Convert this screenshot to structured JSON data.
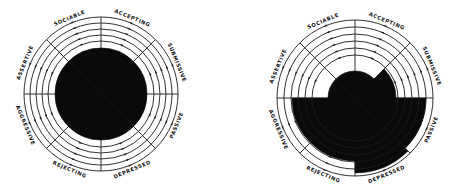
{
  "diagrams": [
    {
      "id": "left",
      "center": [
        101,
        94
      ],
      "outer_radius": 77,
      "ring_radii": [
        77,
        71,
        65,
        59,
        53
      ],
      "fill_color": "#0a0a0a",
      "line_color": "#1a1a1a",
      "sectors": [
        {
          "label": "SOCIABLE",
          "start_deg": 90,
          "end_deg": 135,
          "fill_radius": 46
        },
        {
          "label": "ACCEPTING",
          "start_deg": 45,
          "end_deg": 90,
          "fill_radius": 46
        },
        {
          "label": "SUBMISSIVE",
          "start_deg": 0,
          "end_deg": 45,
          "fill_radius": 46
        },
        {
          "label": "PASSIVE",
          "start_deg": -45,
          "end_deg": 0,
          "fill_radius": 46
        },
        {
          "label": "DEPRESSED",
          "start_deg": -90,
          "end_deg": -45,
          "fill_radius": 46
        },
        {
          "label": "REJECTING",
          "start_deg": -135,
          "end_deg": -90,
          "fill_radius": 46
        },
        {
          "label": "AGGRESSIVE",
          "start_deg": -180,
          "end_deg": -135,
          "fill_radius": 46
        },
        {
          "label": "ASSERTIVE",
          "start_deg": 135,
          "end_deg": 180,
          "fill_radius": 46
        }
      ]
    },
    {
      "id": "right",
      "center": [
        355,
        98
      ],
      "outer_radius": 78,
      "ring_radii": [
        78,
        71,
        64,
        57,
        50,
        43
      ],
      "fill_color": "#0a0a0a",
      "line_color": "#1a1a1a",
      "sectors": [
        {
          "label": "SOCIABLE",
          "start_deg": 90,
          "end_deg": 135,
          "fill_radius": 27
        },
        {
          "label": "ACCEPTING",
          "start_deg": 45,
          "end_deg": 90,
          "fill_radius": 27
        },
        {
          "label": "SUBMISSIVE",
          "start_deg": 0,
          "end_deg": 45,
          "fill_radius": 41
        },
        {
          "label": "PASSIVE",
          "start_deg": -45,
          "end_deg": 0,
          "fill_radius": 71
        },
        {
          "label": "DEPRESSED",
          "start_deg": -90,
          "end_deg": -45,
          "fill_radius": 75
        },
        {
          "label": "REJECTING",
          "start_deg": -135,
          "end_deg": -90,
          "fill_radius": 63
        },
        {
          "label": "AGGRESSIVE",
          "start_deg": -180,
          "end_deg": -135,
          "fill_radius": 63
        },
        {
          "label": "ASSERTIVE",
          "start_deg": 135,
          "end_deg": 180,
          "fill_radius": 27
        }
      ]
    }
  ]
}
